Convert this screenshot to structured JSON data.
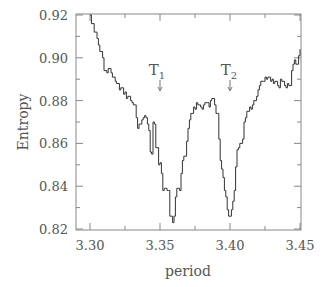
{
  "chart_data": {
    "type": "line",
    "title": "",
    "xlabel": "period",
    "ylabel": "Entropy",
    "xlim": [
      3.29,
      3.45
    ],
    "ylim": [
      0.82,
      0.92
    ],
    "grid": false,
    "legend": null,
    "x_ticks": [
      "3.30",
      "3.35",
      "3.40",
      "3.45"
    ],
    "x_tick_values": [
      3.3,
      3.35,
      3.4,
      3.45
    ],
    "y_ticks": [
      "0.82",
      "0.84",
      "0.86",
      "0.88",
      "0.90",
      "0.92"
    ],
    "y_tick_values": [
      0.82,
      0.84,
      0.86,
      0.88,
      0.9,
      0.92
    ],
    "annotations": [
      {
        "label": "T",
        "subscript": "1",
        "x": 3.35,
        "arrow_to_y": 0.886
      },
      {
        "label": "T",
        "subscript": "2",
        "x": 3.4,
        "arrow_to_y": 0.886
      }
    ],
    "series": [
      {
        "name": "Entropy",
        "x": [
          3.3,
          3.301,
          3.303,
          3.305,
          3.306,
          3.307,
          3.309,
          3.31,
          3.312,
          3.313,
          3.315,
          3.316,
          3.318,
          3.319,
          3.321,
          3.322,
          3.324,
          3.325,
          3.326,
          3.327,
          3.329,
          3.33,
          3.331,
          3.333,
          3.334,
          3.335,
          3.336,
          3.337,
          3.338,
          3.339,
          3.34,
          3.341,
          3.342,
          3.343,
          3.344,
          3.345,
          3.346,
          3.347,
          3.349,
          3.35,
          3.351,
          3.352,
          3.353,
          3.354,
          3.355,
          3.356,
          3.357,
          3.358,
          3.359,
          3.36,
          3.361,
          3.362,
          3.364,
          3.365,
          3.366,
          3.367,
          3.369,
          3.37,
          3.371,
          3.372,
          3.374,
          3.375,
          3.376,
          3.377,
          3.379,
          3.38,
          3.381,
          3.382,
          3.384,
          3.385,
          3.386,
          3.387,
          3.389,
          3.39,
          3.391,
          3.392,
          3.393,
          3.394,
          3.395,
          3.396,
          3.397,
          3.398,
          3.399,
          3.4,
          3.401,
          3.402,
          3.403,
          3.404,
          3.405,
          3.406,
          3.407,
          3.409,
          3.41,
          3.411,
          3.412,
          3.414,
          3.415,
          3.416,
          3.417,
          3.419,
          3.42,
          3.421,
          3.422,
          3.424,
          3.425,
          3.426,
          3.427,
          3.429,
          3.43,
          3.431,
          3.432,
          3.434,
          3.435,
          3.436,
          3.437,
          3.439,
          3.44,
          3.441,
          3.442,
          3.444,
          3.445,
          3.446,
          3.447,
          3.449,
          3.45
        ],
        "values": [
          0.92,
          0.916,
          0.912,
          0.909,
          0.906,
          0.903,
          0.9,
          0.894,
          0.893,
          0.895,
          0.893,
          0.891,
          0.889,
          0.888,
          0.885,
          0.886,
          0.883,
          0.884,
          0.881,
          0.882,
          0.88,
          0.879,
          0.878,
          0.872,
          0.867,
          0.869,
          0.869,
          0.871,
          0.872,
          0.873,
          0.872,
          0.869,
          0.866,
          0.856,
          0.855,
          0.87,
          0.869,
          0.858,
          0.85,
          0.851,
          0.846,
          0.838,
          0.839,
          0.839,
          0.838,
          0.838,
          0.826,
          0.826,
          0.823,
          0.826,
          0.835,
          0.839,
          0.838,
          0.846,
          0.852,
          0.854,
          0.861,
          0.867,
          0.871,
          0.874,
          0.877,
          0.876,
          0.879,
          0.878,
          0.877,
          0.876,
          0.878,
          0.879,
          0.879,
          0.877,
          0.88,
          0.881,
          0.878,
          0.874,
          0.874,
          0.862,
          0.852,
          0.848,
          0.844,
          0.838,
          0.835,
          0.829,
          0.826,
          0.826,
          0.829,
          0.833,
          0.838,
          0.849,
          0.857,
          0.858,
          0.86,
          0.862,
          0.87,
          0.872,
          0.875,
          0.877,
          0.876,
          0.878,
          0.88,
          0.882,
          0.885,
          0.887,
          0.889,
          0.889,
          0.891,
          0.89,
          0.891,
          0.889,
          0.89,
          0.888,
          0.889,
          0.887,
          0.886,
          0.89,
          0.889,
          0.887,
          0.886,
          0.888,
          0.887,
          0.894,
          0.897,
          0.899,
          0.897,
          0.901,
          0.904
        ]
      }
    ]
  },
  "plot": {
    "ylabel": "Entropy",
    "xlabel": "period",
    "annotation_t1_main": "T",
    "annotation_t1_sub": "1",
    "annotation_t2_main": "T",
    "annotation_t2_sub": "2",
    "line_color": "#333333",
    "axis_color": "#888888",
    "text_color": "#555555"
  }
}
